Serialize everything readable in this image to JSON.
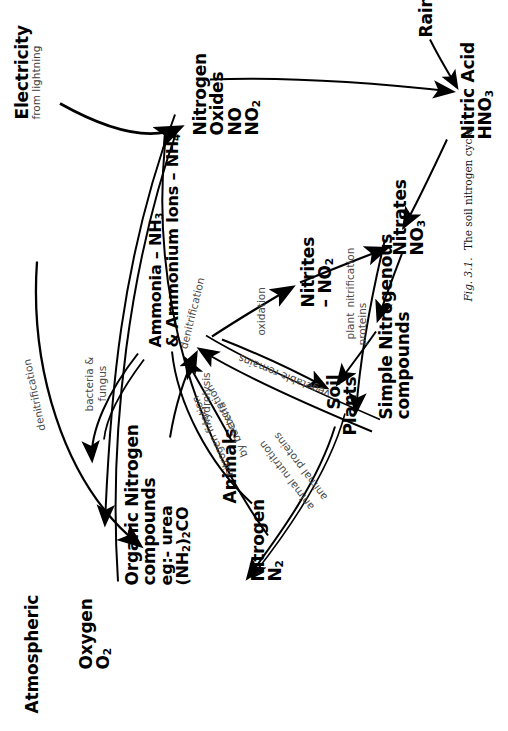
{
  "figure": {
    "caption_prefix": "Fig. 3.1.",
    "caption_text": "The soil nitrogen cycle.",
    "rotation_deg": -90,
    "ink_color": "#000000",
    "label_color": "#4a4a4a",
    "background": "#ffffff"
  },
  "nodes": {
    "atmospheric": {
      "label": "Atmospheric"
    },
    "nitrogen": {
      "line1": "Nitrogen",
      "line2": "N",
      "line2_sub": "2"
    },
    "oxygen": {
      "line1": "Oxygen",
      "line2": "O",
      "line2_sub": "2"
    },
    "electricity": {
      "line1": "Electricity",
      "line2": "from lightning"
    },
    "nitrogen_oxides": {
      "line1": "Nitrogen",
      "line2": "Oxides",
      "line3": "NO",
      "line4": "NO",
      "line4_sub": "2"
    },
    "nitric_acid": {
      "line1": "Nitric Acid",
      "line2": "HNO",
      "line2_sub": "3"
    },
    "rain": {
      "label": "Rain"
    },
    "plants": {
      "label": "Plants"
    },
    "animals": {
      "label": "Animals"
    },
    "soil": {
      "label": "Soil"
    },
    "organic_nitrogen": {
      "line1": "Organic Nitrogen",
      "line2": "compounds",
      "line3": "eg:- urea",
      "line4_a": "(NH",
      "line4_sub1": "2",
      "line4_b": ")",
      "line4_sub2": "2",
      "line4_c": "CO"
    },
    "ammonia": {
      "line1_a": "Ammonia – NH",
      "line1_sub": "3",
      "line2_a": "& Ammonium Ions – NH",
      "line2_sub": "4",
      "line2_sup": "+"
    },
    "nitrites": {
      "line1": "Nitrites",
      "line2": "– NO",
      "line2_sub": "2"
    },
    "nitrates": {
      "line1": "Nitrates",
      "line2": "NO",
      "line2_sub": "3"
    },
    "simple_nitrogenous": {
      "line1": "Simple Nitrogenous",
      "line2": "compounds"
    }
  },
  "edge_labels": {
    "denitrification_top": "denitrification",
    "denitrification_left": "denitrification",
    "nitrogen_fixation_1": "nitrogen fixation",
    "nitrogen_fixation_2": "by bacteria",
    "bacteria_fungus_1": "bacteria &",
    "bacteria_fungus_2": "fungus",
    "hydrolysis": "hydrolysis",
    "oxidation": "oxidation",
    "nitrification": "nitrification",
    "excretion": "excretion",
    "vegetable_remains": "vegetable remains",
    "animal_nutrition": "animal nutrition",
    "animal_proteins": "animal proteins",
    "plant_proteins_1": "plant",
    "plant_proteins_2": "proteins"
  }
}
